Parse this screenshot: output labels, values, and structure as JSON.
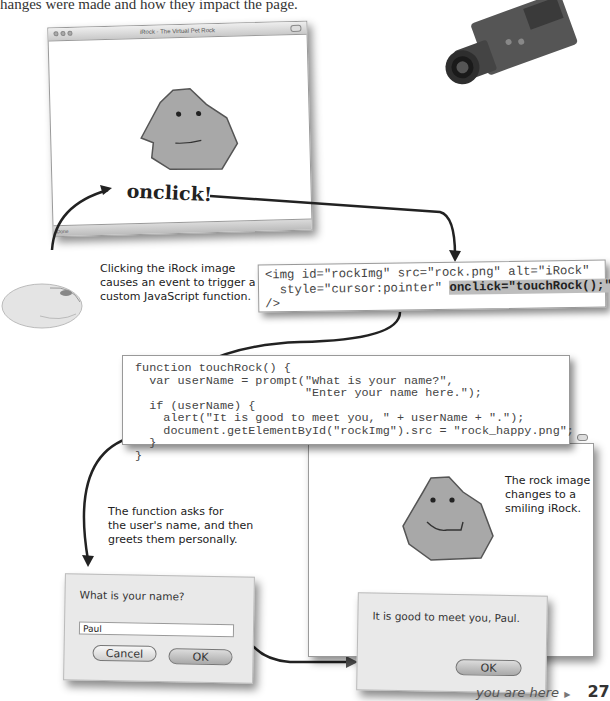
{
  "intro_text": "hanges were made and how they impact the page.",
  "window_top": {
    "title": "iRock - The Virtual Pet Rock",
    "status": "Done",
    "event_label": "onclick!"
  },
  "annotations": {
    "click": [
      "Clicking the iRock image",
      "causes an event to trigger a",
      "custom JavaScript function."
    ],
    "function": [
      "The function asks for",
      "the user's name, and then",
      "greets them personally."
    ],
    "rock_change": [
      "The rock image",
      "changes to a",
      "smiling iRock."
    ]
  },
  "code_img": {
    "line1": "<img id=\"rockImg\" src=\"rock.png\" alt=\"iRock\"",
    "line2_pre": "  style=\"cursor:pointer\" ",
    "line2_hl": "onclick=\"touchRock();\"",
    "line3": "/>"
  },
  "code_function": {
    "lines": [
      "function touchRock() {",
      "  var userName = prompt(\"What is your name?\",",
      "                        \"Enter your name here.\");",
      "  if (userName) {",
      "    alert(\"It is good to meet you, \" + userName + \".\");",
      "    document.getElementById(\"rockImg\").src = \"rock_happy.png\";",
      "  }",
      "}"
    ]
  },
  "prompt_dialog": {
    "label": "What is your name?",
    "input_value": "Paul",
    "cancel_label": "Cancel",
    "ok_label": "OK"
  },
  "alert_dialog": {
    "message": "It is good to meet you, Paul.",
    "ok_label": "OK"
  },
  "footer": {
    "you_are_here": "you are here",
    "page_number": "27"
  },
  "colors": {
    "rock_fill": "#a8a8a8",
    "rock_stroke": "#555555",
    "highlight": "#bdbdbd"
  }
}
